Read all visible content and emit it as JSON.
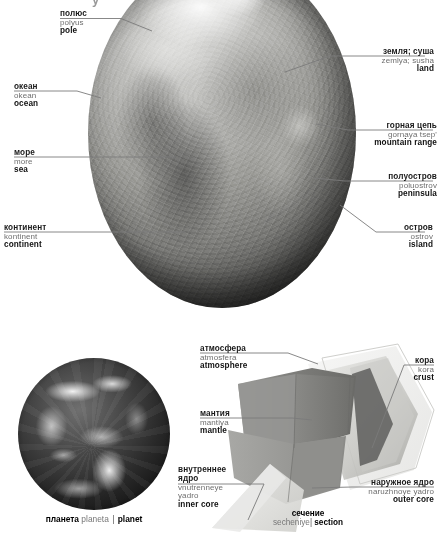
{
  "page": {
    "title_fragment": "у",
    "background_color": "#ffffff"
  },
  "top_figure": {
    "name": "earth-globe-relief",
    "labels": [
      {
        "id": "pole",
        "ru": "полюс",
        "translit": "polyus",
        "en": "pole"
      },
      {
        "id": "ocean",
        "ru": "океан",
        "translit": "okean",
        "en": "ocean"
      },
      {
        "id": "sea",
        "ru": "море",
        "translit": "more",
        "en": "sea"
      },
      {
        "id": "continent",
        "ru": "континент",
        "translit": "kontinent",
        "en": "continent"
      },
      {
        "id": "land",
        "ru": "земля; суша",
        "translit": "zemlya; susha",
        "en": "land"
      },
      {
        "id": "mountain-range",
        "ru": "горная цепь",
        "translit": "gornaya tsep'",
        "en": "mountain range"
      },
      {
        "id": "peninsula",
        "ru": "полуостров",
        "translit": "poluostrov",
        "en": "peninsula"
      },
      {
        "id": "island",
        "ru": "остров",
        "translit": "ostrov",
        "en": "island"
      }
    ]
  },
  "bottom_figure": {
    "planet_caption": {
      "ru": "планета",
      "translit": "planeta",
      "separator": "|",
      "en": "planet"
    },
    "section_caption": {
      "ru": "сечение",
      "translit": "secheniye",
      "separator": "|",
      "en": "section"
    },
    "labels": [
      {
        "id": "atmosphere",
        "ru": "атмосфера",
        "translit": "atmosfera",
        "en": "atmosphere"
      },
      {
        "id": "mantle",
        "ru": "мантия",
        "translit": "mantiya",
        "en": "mantle"
      },
      {
        "id": "inner-core",
        "ru_line1": "внутреннее",
        "ru_line2": "ядро",
        "translit_line1": "vnutrenneye",
        "translit_line2": "yadro",
        "en": "inner core"
      },
      {
        "id": "crust",
        "ru": "кора",
        "translit": "kora",
        "en": "crust"
      },
      {
        "id": "outer-core",
        "ru": "наружное ядро",
        "translit": "naruzhnoye yadro",
        "en": "outer core"
      }
    ]
  },
  "colors": {
    "rule_line": "#8a8a8a",
    "leader_line": "#6f6f6f",
    "translit_text": "#6e6e6e",
    "primary_text": "#111111",
    "crust_band": "#d7d7d3",
    "mantle_band": "#8d8d8a",
    "outer_core_band": "#9a9a97",
    "inner_core_band": "#cfcfcc",
    "atmosphere_band": "#e6e6e4"
  }
}
